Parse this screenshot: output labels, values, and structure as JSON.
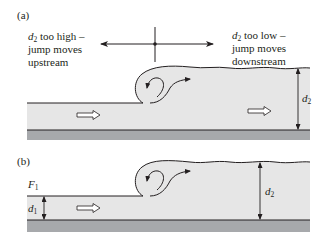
{
  "figure": {
    "panel_a": {
      "label": "(a)",
      "left_note": {
        "var": "d",
        "sub": "2",
        "line1_rest": " too high –",
        "line2": "jump moves",
        "line3": "upstream"
      },
      "right_note": {
        "var": "d",
        "sub": "2",
        "line1_rest": " too low –",
        "line2": "jump moves",
        "line3": "downstream"
      },
      "depth_label": {
        "var": "d",
        "sub": "2"
      }
    },
    "panel_b": {
      "label": "(b)",
      "froude_label": {
        "var": "F",
        "sub": "1"
      },
      "upstream_depth_label": {
        "var": "d",
        "sub": "1"
      },
      "downstream_depth_label": {
        "var": "d",
        "sub": "2"
      }
    },
    "colors": {
      "water": "#e6e6e6",
      "bed": "#a7a9ac",
      "line": "#231f20"
    }
  }
}
